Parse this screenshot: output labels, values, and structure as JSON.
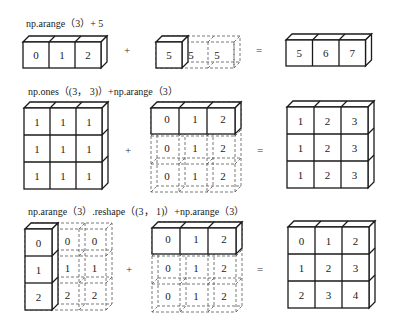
{
  "diagram": {
    "rows": [
      {
        "caption": "np.arange（3）+ 5",
        "operand_a": {
          "shape": [
            1,
            3
          ],
          "values": [
            [
              0,
              1,
              2
            ]
          ],
          "broadcast": null
        },
        "operator": "+",
        "operand_b": {
          "shape": [
            1,
            1
          ],
          "values": [
            [
              5
            ]
          ],
          "broadcast_values": [
            [
              5,
              5,
              5
            ]
          ],
          "broadcast_direction": "horizontal"
        },
        "equals": "=",
        "result": {
          "shape": [
            1,
            3
          ],
          "values": [
            [
              5,
              6,
              7
            ]
          ]
        }
      },
      {
        "caption": "np.ones（(3， 3)）+np.arange（3）",
        "operand_a": {
          "shape": [
            3,
            3
          ],
          "values": [
            [
              1,
              1,
              1
            ],
            [
              1,
              1,
              1
            ],
            [
              1,
              1,
              1
            ]
          ]
        },
        "operator": "+",
        "operand_b": {
          "shape": [
            1,
            3
          ],
          "values": [
            [
              0,
              1,
              2
            ]
          ],
          "broadcast_values": [
            [
              0,
              1,
              2
            ],
            [
              0,
              1,
              2
            ],
            [
              0,
              1,
              2
            ]
          ],
          "broadcast_direction": "vertical"
        },
        "equals": "=",
        "result": {
          "shape": [
            3,
            3
          ],
          "values": [
            [
              1,
              2,
              3
            ],
            [
              1,
              2,
              3
            ],
            [
              1,
              2,
              3
            ]
          ]
        }
      },
      {
        "caption": "np.arange（3）.reshape（(3， 1)）+np.arange（3）",
        "operand_a": {
          "shape": [
            3,
            1
          ],
          "values": [
            [
              0
            ],
            [
              1
            ],
            [
              2
            ]
          ],
          "broadcast_values": [
            [
              0,
              0,
              0
            ],
            [
              1,
              1,
              1
            ],
            [
              2,
              2,
              2
            ]
          ],
          "broadcast_direction": "horizontal"
        },
        "operator": "+",
        "operand_b": {
          "shape": [
            1,
            3
          ],
          "values": [
            [
              0,
              1,
              2
            ]
          ],
          "broadcast_values": [
            [
              0,
              1,
              2
            ],
            [
              0,
              1,
              2
            ],
            [
              0,
              1,
              2
            ]
          ],
          "broadcast_direction": "vertical"
        },
        "equals": "=",
        "result": {
          "shape": [
            3,
            3
          ],
          "values": [
            [
              0,
              1,
              2
            ],
            [
              1,
              2,
              3
            ],
            [
              2,
              3,
              4
            ]
          ]
        }
      }
    ]
  },
  "colors": {
    "stroke": "#1a1a1a",
    "dashed": "#555555",
    "background": "#ffffff"
  }
}
